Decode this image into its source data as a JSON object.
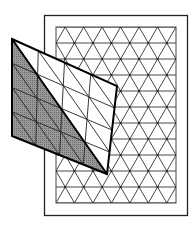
{
  "diagram": {
    "title": "",
    "background_sheet": {
      "pattern": "triangular-lattice",
      "rows": 11,
      "triangle_columns": 6.5
    },
    "overlay_sheet": {
      "grid_columns": 4,
      "grid_rows": 4,
      "shaded_half": "lower-left",
      "shade_color": "#8a8a8a"
    },
    "colors": {
      "line": "#333333",
      "frame": "#222222",
      "background": "#ffffff"
    }
  }
}
